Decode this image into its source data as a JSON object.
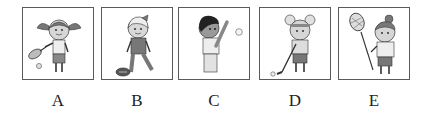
{
  "options": [
    {
      "label": "A",
      "picture": "girl-playing-tennis",
      "items": [
        "tennis-racket",
        "tennis-ball"
      ]
    },
    {
      "label": "B",
      "picture": "girl-with-football",
      "items": [
        "american-football"
      ]
    },
    {
      "label": "C",
      "picture": "girl-playing-baseball",
      "items": [
        "baseball-bat",
        "baseball"
      ]
    },
    {
      "label": "D",
      "picture": "girl-playing-golf",
      "items": [
        "golf-club",
        "golf-ball"
      ]
    },
    {
      "label": "E",
      "picture": "girl-with-lacrosse-stick",
      "items": [
        "lacrosse-stick"
      ]
    }
  ],
  "colors": {
    "border": "#5a5a5a",
    "line": "#333333",
    "skin": "#cfcfcf",
    "hair": "#777777",
    "shirt": "#e6e6e6",
    "shorts": "#888888"
  }
}
